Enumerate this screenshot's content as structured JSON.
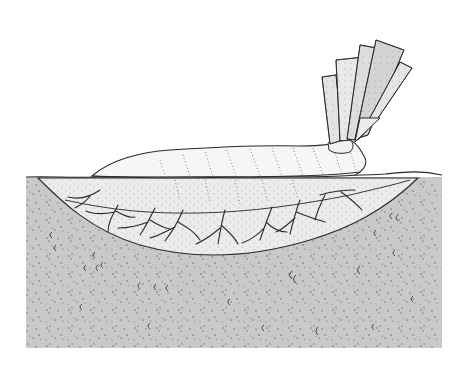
{
  "figure": {
    "description": "Line illustration of a soft-bodied organism lying in a shallow depression in sediment, with a fan of flat leaf-like fronds at one end",
    "colors": {
      "background": "#ffffff",
      "sediment": "#c9c9c9",
      "sediment_dots": "#6a6a6a",
      "body_fill": "#f4f4f4",
      "burrow_fill": "#ececec",
      "frond_fill": "#e2e2e2",
      "outline": "#2a2a2a"
    },
    "parts": [
      "sediment-block",
      "burrow-depression",
      "body",
      "root-like-branches",
      "frond-fan",
      "shell-fragments"
    ]
  }
}
